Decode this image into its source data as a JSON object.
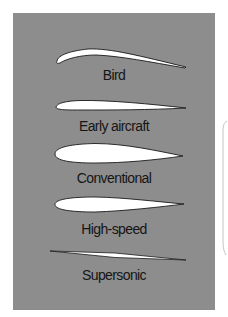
{
  "figure": {
    "panel_color": "#8d8d8d",
    "airfoil_fill": "#ffffff",
    "airfoil_outline": "#1a1a1a",
    "label_color": "#151515",
    "airfoils": [
      {
        "label": "Bird"
      },
      {
        "label": "Early aircraft"
      },
      {
        "label": "Conventional"
      },
      {
        "label": "High-speed"
      },
      {
        "label": "Supersonic"
      }
    ]
  }
}
